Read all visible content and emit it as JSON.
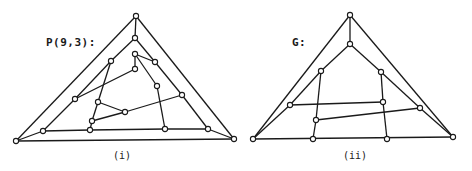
{
  "diagrams": [
    {
      "id": "i",
      "title": "P(9,3):",
      "caption": "(i)",
      "stroke": "#1a1a1a",
      "nodes": {
        "A": [
          136,
          16
        ],
        "B": [
          16,
          141
        ],
        "C": [
          234,
          139
        ],
        "D": [
          135,
          38
        ],
        "E": [
          111,
          61
        ],
        "F": [
          135,
          54
        ],
        "G": [
          155,
          62
        ],
        "H": [
          135,
          69
        ],
        "I": [
          157,
          86
        ],
        "J": [
          75,
          99
        ],
        "K": [
          98,
          102
        ],
        "L": [
          182,
          95
        ],
        "M": [
          125,
          112
        ],
        "N": [
          92,
          121
        ],
        "O": [
          43,
          131
        ],
        "P": [
          90,
          130
        ],
        "Q": [
          165,
          129
        ],
        "R": [
          208,
          129
        ]
      },
      "edges": [
        [
          "A",
          "B"
        ],
        [
          "A",
          "C"
        ],
        [
          "B",
          "C"
        ],
        [
          "A",
          "D"
        ],
        [
          "D",
          "E"
        ],
        [
          "E",
          "J"
        ],
        [
          "J",
          "O"
        ],
        [
          "O",
          "B"
        ],
        [
          "D",
          "G"
        ],
        [
          "G",
          "L"
        ],
        [
          "L",
          "R"
        ],
        [
          "R",
          "C"
        ],
        [
          "O",
          "P"
        ],
        [
          "P",
          "Q"
        ],
        [
          "Q",
          "R"
        ],
        [
          "F",
          "G"
        ],
        [
          "F",
          "H"
        ],
        [
          "F",
          "I"
        ],
        [
          "H",
          "J"
        ],
        [
          "I",
          "Q"
        ],
        [
          "E",
          "K"
        ],
        [
          "K",
          "M"
        ],
        [
          "K",
          "N"
        ],
        [
          "N",
          "P"
        ],
        [
          "N",
          "M"
        ],
        [
          "M",
          "L"
        ]
      ]
    },
    {
      "id": "ii",
      "title": "G:",
      "caption": "(ii)",
      "stroke": "#1a1a1a",
      "nodes": {
        "A": [
          350,
          15
        ],
        "B": [
          253,
          139
        ],
        "C": [
          453,
          137
        ],
        "D": [
          350,
          44
        ],
        "E": [
          321,
          71
        ],
        "F": [
          381,
          72
        ],
        "G": [
          290,
          105
        ],
        "H": [
          383,
          102
        ],
        "I": [
          420,
          108
        ],
        "J": [
          316,
          120
        ],
        "K": [
          313,
          139
        ],
        "L": [
          387,
          139
        ]
      },
      "edges": [
        [
          "A",
          "B"
        ],
        [
          "A",
          "C"
        ],
        [
          "B",
          "C"
        ],
        [
          "A",
          "D"
        ],
        [
          "D",
          "E"
        ],
        [
          "E",
          "G"
        ],
        [
          "G",
          "B"
        ],
        [
          "D",
          "F"
        ],
        [
          "F",
          "I"
        ],
        [
          "I",
          "C"
        ],
        [
          "E",
          "J"
        ],
        [
          "J",
          "K"
        ],
        [
          "F",
          "H"
        ],
        [
          "H",
          "L"
        ],
        [
          "G",
          "H"
        ],
        [
          "J",
          "I"
        ]
      ]
    }
  ]
}
